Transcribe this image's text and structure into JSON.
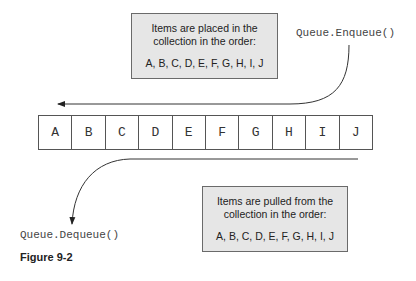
{
  "enqueue_box": {
    "line1": "Items are placed in the",
    "line2": "collection in the order:",
    "order": "A, B, C, D, E, F, G, H, I, J"
  },
  "enqueue_label": "Queue.Enqueue()",
  "queue": {
    "cells": [
      "A",
      "B",
      "C",
      "D",
      "E",
      "F",
      "G",
      "H",
      "I",
      "J"
    ]
  },
  "dequeue_box": {
    "line1": "Items are pulled from the",
    "line2": "collection in the order:",
    "order": "A, B, C, D, E, F, G, H, I, J"
  },
  "dequeue_label": "Queue.Dequeue()",
  "caption": "Figure 9-2"
}
